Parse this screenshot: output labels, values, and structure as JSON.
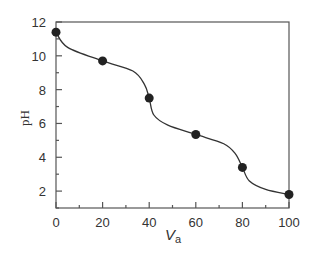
{
  "chart_data": {
    "type": "line",
    "title": "",
    "xlabel": "V",
    "xlabel_sub": "a",
    "ylabel": "pH",
    "xlim": [
      0,
      100
    ],
    "ylim": [
      1,
      12
    ],
    "x_ticks": [
      "0",
      "20",
      "40",
      "60",
      "80",
      "100"
    ],
    "y_ticks": [
      "2",
      "4",
      "6",
      "8",
      "10",
      "12"
    ],
    "grid": false,
    "series": [
      {
        "name": "titration points",
        "x": [
          0,
          20,
          40,
          60,
          80,
          100
        ],
        "values": [
          11.4,
          9.7,
          7.5,
          5.35,
          3.4,
          1.8
        ],
        "marker": "circle"
      }
    ],
    "curve": {
      "x": [
        0,
        5,
        20,
        33,
        38,
        40,
        42,
        48,
        60,
        72,
        77,
        80,
        83,
        90,
        100
      ],
      "y": [
        11.4,
        10.5,
        9.7,
        9.1,
        8.3,
        7.5,
        6.5,
        5.9,
        5.35,
        4.8,
        4.2,
        3.4,
        2.6,
        2.1,
        1.8
      ]
    }
  }
}
